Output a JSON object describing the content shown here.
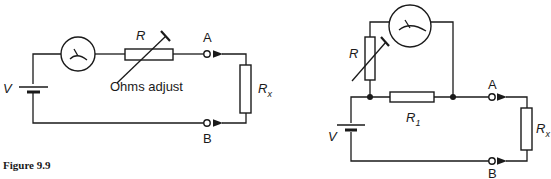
{
  "figure": {
    "caption": "Figure 9.9"
  },
  "left_circuit": {
    "source_label": "V",
    "resistor_label": "R",
    "adjust_label": "Ohms adjust",
    "terminal_a": "A",
    "terminal_b": "B",
    "unknown_label": "R",
    "unknown_subscript": "x",
    "meter_icon": "ohmmeter-dial-icon"
  },
  "right_circuit": {
    "source_label": "V",
    "resistor_label": "R",
    "shunt_label": "R",
    "shunt_subscript": "1",
    "terminal_a": "A",
    "terminal_b": "B",
    "unknown_label": "R",
    "unknown_subscript": "x",
    "meter_icon": "ohmmeter-dial-icon"
  },
  "colors": {
    "ink": "#1a1a1a",
    "background": "#ffffff"
  }
}
